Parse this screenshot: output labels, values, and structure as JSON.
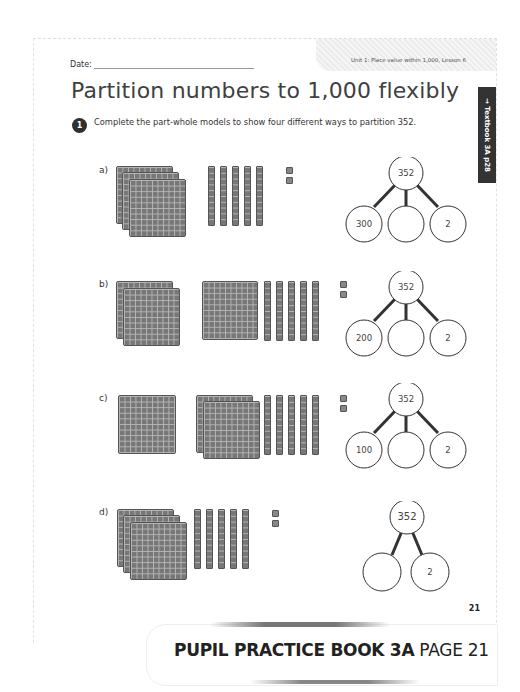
{
  "header": {
    "date_label": "Date:",
    "unit_label": "Unit 1: Place value within 1,000, Lesson 6"
  },
  "title": "Partition numbers to 1,000 flexibly",
  "side_tab": "→ Textbook 3A p28",
  "question": {
    "number": "1",
    "text": "Complete the part-whole models to show four different ways to partition 352."
  },
  "parts": [
    {
      "label": "a)",
      "whole": "352",
      "parts": [
        "300",
        "",
        "2"
      ]
    },
    {
      "label": "b)",
      "whole": "352",
      "parts": [
        "200",
        "",
        "2"
      ]
    },
    {
      "label": "c)",
      "whole": "352",
      "parts": [
        "100",
        "",
        "2"
      ]
    },
    {
      "label": "d)",
      "whole": "352",
      "parts": [
        "",
        "2"
      ]
    }
  ],
  "page_number": "21",
  "banner": {
    "bold": "PUPIL PRACTICE BOOK 3A",
    "normal": "PAGE 21"
  },
  "colors": {
    "block_fill": "#777777",
    "tab_bg": "#333333"
  }
}
